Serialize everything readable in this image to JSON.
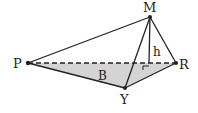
{
  "diagram": {
    "type": "pyramid",
    "colors": {
      "stroke": "#222222",
      "base_fill": "#d4d4d4",
      "label": "#222222"
    },
    "vertices": {
      "M": {
        "label": "M",
        "x": 150,
        "y": 17
      },
      "P": {
        "label": "P",
        "x": 28,
        "y": 63
      },
      "R": {
        "label": "R",
        "x": 176,
        "y": 63
      },
      "Y": {
        "label": "Y",
        "x": 125,
        "y": 88
      }
    },
    "foot": {
      "x": 149,
      "y": 63
    },
    "labels": {
      "M": "M",
      "P": "P",
      "R": "R",
      "Y": "Y",
      "height": "h",
      "base": "B"
    },
    "edges": [
      {
        "from": "M",
        "to": "P",
        "style": "solid"
      },
      {
        "from": "M",
        "to": "R",
        "style": "solid"
      },
      {
        "from": "M",
        "to": "Y",
        "style": "solid"
      },
      {
        "from": "P",
        "to": "Y",
        "style": "solid"
      },
      {
        "from": "Y",
        "to": "R",
        "style": "solid"
      },
      {
        "from": "P",
        "to": "R",
        "style": "dashed"
      },
      {
        "from": "M",
        "to": "foot",
        "style": "solid",
        "meaning": "altitude h"
      }
    ],
    "right_angle_marker": true
  }
}
